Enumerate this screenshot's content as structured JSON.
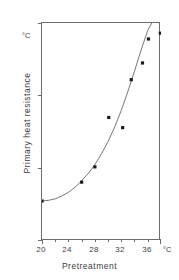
{
  "chart_data": {
    "type": "scatter",
    "title": "",
    "subtitle": "",
    "xlabel": "Pretreatment",
    "ylabel": "Primary heat resistance",
    "x_unit": "°C",
    "y_unit": "°C",
    "xlim": [
      20,
      38
    ],
    "ylim": [
      44,
      47
    ],
    "grid": false,
    "legend": null,
    "x_ticks_major": [
      20,
      24,
      28,
      32,
      36
    ],
    "x_tick_labels": [
      "20",
      "24",
      "28",
      "32",
      "36"
    ],
    "x_ticks_minor": [
      22,
      26,
      30,
      34,
      38
    ],
    "y_ticks": [
      44,
      45,
      46,
      47
    ],
    "y_tick_labels": [
      "44",
      "45",
      "46",
      "47"
    ],
    "marker_color": "#1a1a1a",
    "line_color": "#777777",
    "axis_color": "#6d6d6d",
    "points": [
      {
        "x": 20.0,
        "y": 44.55
      },
      {
        "x": 26.0,
        "y": 44.81
      },
      {
        "x": 28.0,
        "y": 45.02
      },
      {
        "x": 30.1,
        "y": 45.7
      },
      {
        "x": 32.2,
        "y": 45.56
      },
      {
        "x": 33.5,
        "y": 46.22
      },
      {
        "x": 35.2,
        "y": 46.45
      },
      {
        "x": 36.1,
        "y": 46.78
      },
      {
        "x": 37.9,
        "y": 46.86
      }
    ],
    "series": [
      {
        "name": "fitted curve",
        "x": [
          20.0,
          21.0,
          22.0,
          23.0,
          24.0,
          25.0,
          26.0,
          27.0,
          28.0,
          29.0,
          30.0,
          31.0,
          32.0,
          33.0,
          34.0,
          35.0,
          36.0,
          36.6
        ],
        "y": [
          44.55,
          44.56,
          44.58,
          44.62,
          44.67,
          44.74,
          44.83,
          44.93,
          45.05,
          45.2,
          45.37,
          45.57,
          45.8,
          46.06,
          46.34,
          46.63,
          46.9,
          47.0
        ]
      }
    ]
  },
  "axes": {
    "y_unit_caption": "°C",
    "x_unit_caption": "°C",
    "y_axis_title": "Primary heat resistance",
    "x_axis_title": "Pretreatment"
  }
}
